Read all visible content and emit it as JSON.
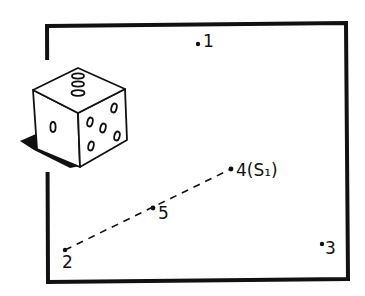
{
  "figure": {
    "die": {
      "top_face_pips": 3,
      "left_face_pips": 1,
      "right_face_pips": 5,
      "has_shadow": true
    },
    "points": [
      {
        "id": "1",
        "label": "1",
        "x": 198,
        "y": 43
      },
      {
        "id": "2",
        "label": "2",
        "x": 65,
        "y": 250
      },
      {
        "id": "3",
        "label": "3",
        "x": 322,
        "y": 244
      },
      {
        "id": "4",
        "label": "4(S₁)",
        "x": 231,
        "y": 169
      },
      {
        "id": "5",
        "label": "5",
        "x": 153,
        "y": 208
      }
    ],
    "dashed_line": {
      "from": "2",
      "through": "5",
      "to": "4"
    },
    "colors": {
      "ink": "#111111",
      "background": "#ffffff"
    }
  }
}
